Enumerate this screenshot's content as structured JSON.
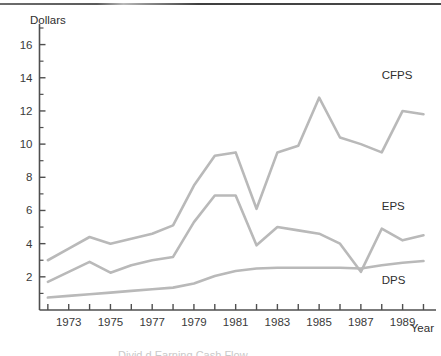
{
  "chart_data": {
    "type": "line",
    "title": "",
    "ylabel": "Dollars",
    "xlabel": "Year",
    "ylim": [
      0,
      17
    ],
    "xlim": [
      1971.6,
      1990.6
    ],
    "grid": false,
    "legend_position": "inline-right",
    "y_ticks": [
      2,
      4,
      6,
      8,
      10,
      12,
      14,
      16
    ],
    "y_minor_ticks": [
      1,
      3,
      5,
      7,
      9,
      11,
      13,
      15,
      17
    ],
    "x_ticks": [
      1972,
      1973,
      1974,
      1975,
      1976,
      1977,
      1978,
      1979,
      1980,
      1981,
      1982,
      1983,
      1984,
      1985,
      1986,
      1987,
      1988,
      1989,
      1990
    ],
    "x_tick_labels": [
      "",
      "1973",
      "",
      "1975",
      "",
      "1977",
      "",
      "1979",
      "",
      "1981",
      "",
      "1983",
      "",
      "1985",
      "",
      "1987",
      "",
      "1989",
      ""
    ],
    "x": [
      1972,
      1973,
      1974,
      1975,
      1976,
      1977,
      1978,
      1979,
      1980,
      1981,
      1982,
      1983,
      1984,
      1985,
      1986,
      1987,
      1988,
      1989,
      1990
    ],
    "series": [
      {
        "name": "CFPS",
        "color": "#b9b9b9",
        "values": [
          3.0,
          3.7,
          4.4,
          4.0,
          4.3,
          4.6,
          5.1,
          7.5,
          9.3,
          9.5,
          6.1,
          9.5,
          9.9,
          12.8,
          10.4,
          10.0,
          9.5,
          12.0,
          11.8
        ]
      },
      {
        "name": "EPS",
        "color": "#b9b9b9",
        "values": [
          1.7,
          2.3,
          2.9,
          2.25,
          2.7,
          3.0,
          3.2,
          5.3,
          6.9,
          6.9,
          3.9,
          5.0,
          4.8,
          4.6,
          4.0,
          2.3,
          4.9,
          4.2,
          4.5
        ]
      },
      {
        "name": "DPS",
        "color": "#b9b9b9",
        "values": [
          0.75,
          0.85,
          0.95,
          1.05,
          1.15,
          1.25,
          1.35,
          1.6,
          2.05,
          2.35,
          2.5,
          2.55,
          2.55,
          2.55,
          2.55,
          2.5,
          2.7,
          2.85,
          2.95
        ]
      }
    ],
    "annotations": [
      {
        "text": "CFPS",
        "x": 1988.0,
        "y": 13.9
      },
      {
        "text": "EPS",
        "x": 1988.0,
        "y": 6.0
      },
      {
        "text": "DPS",
        "x": 1988.0,
        "y": 1.55
      }
    ]
  },
  "bottom_text": "Divid  d            Earning                      Cash Flow"
}
